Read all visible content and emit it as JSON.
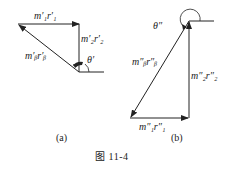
{
  "figure": {
    "caption": "图   11-4",
    "panels": [
      {
        "id": "a",
        "label": "(a)",
        "vectors": [
          {
            "name": "m1_r1",
            "label": "m′₁r′₁"
          },
          {
            "name": "m2_r2",
            "label": "m′₂r′₂"
          },
          {
            "name": "mb_rb",
            "label": "m′ᵦr′ᵦ"
          }
        ],
        "angle": "θ′"
      },
      {
        "id": "b",
        "label": "(b)",
        "vectors": [
          {
            "name": "m1_r1",
            "label": "m″₁r″₁"
          },
          {
            "name": "m2_r2",
            "label": "m″₂r″₂"
          },
          {
            "name": "mb_rb",
            "label": "m″ᵦr″ᵦ"
          }
        ],
        "angle": "θ″"
      }
    ]
  }
}
